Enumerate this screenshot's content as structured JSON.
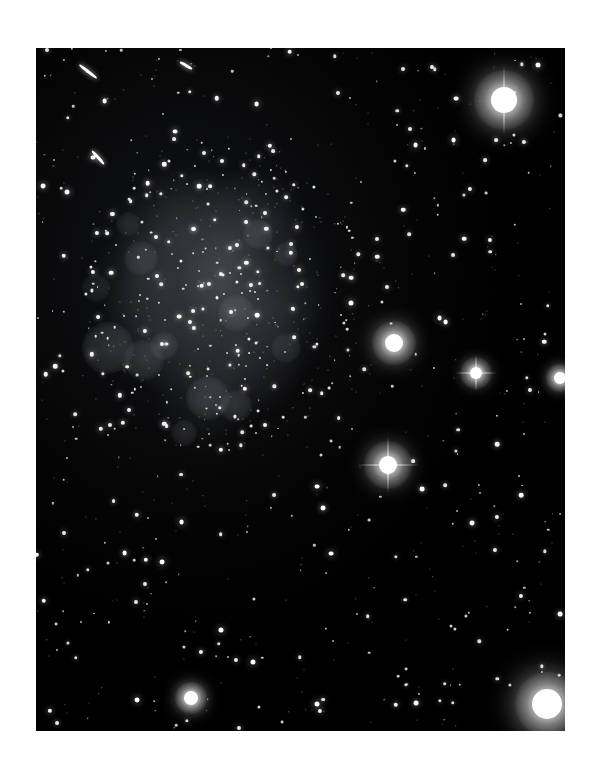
{
  "page": {
    "background_color": "#ffffff",
    "width": 594,
    "height": 779,
    "caption": ""
  },
  "plate": {
    "name": "astronomical-photographic-plate",
    "background_color": "#000000",
    "left": 36,
    "top": 48,
    "width": 529,
    "height": 683,
    "description": "Deep monochrome sky image of an irregular dwarf galaxy resolved into stars, surrounded by a dense foreground star field"
  },
  "chart_data": {
    "type": "scatter",
    "title": "",
    "subtitle": "",
    "xlabel": "",
    "ylabel": "",
    "xlim": [
      0,
      529
    ],
    "ylim": [
      0,
      683
    ],
    "grid": false,
    "legend": "none",
    "colormap": "grayscale",
    "background": "#000000",
    "note": "Pixel coordinates are relative to the plate frame (origin top-left of the black image area).",
    "galaxy": {
      "name": "irregular-dwarf-galaxy",
      "center_x": 185,
      "center_y": 245,
      "radius_x": 150,
      "radius_y": 165,
      "peak_brightness": 0.42,
      "morphology": "irregular / patchy, resolved into individual stars, sharp cutoff on east (right) side"
    },
    "hii_regions": [
      {
        "x": 72,
        "y": 300,
        "r": 26,
        "b": 0.17
      },
      {
        "x": 108,
        "y": 312,
        "r": 20,
        "b": 0.14
      },
      {
        "x": 128,
        "y": 298,
        "r": 14,
        "b": 0.12
      },
      {
        "x": 172,
        "y": 350,
        "r": 22,
        "b": 0.15
      },
      {
        "x": 200,
        "y": 358,
        "r": 16,
        "b": 0.13
      },
      {
        "x": 148,
        "y": 385,
        "r": 13,
        "b": 0.11
      },
      {
        "x": 222,
        "y": 186,
        "r": 15,
        "b": 0.12
      },
      {
        "x": 250,
        "y": 206,
        "r": 12,
        "b": 0.11
      },
      {
        "x": 105,
        "y": 210,
        "r": 17,
        "b": 0.12
      },
      {
        "x": 60,
        "y": 240,
        "r": 14,
        "b": 0.1
      },
      {
        "x": 200,
        "y": 265,
        "r": 18,
        "b": 0.13
      },
      {
        "x": 250,
        "y": 300,
        "r": 15,
        "b": 0.11
      },
      {
        "x": 92,
        "y": 176,
        "r": 12,
        "b": 0.1
      }
    ],
    "bright_stars": [
      {
        "x": 468,
        "y": 52,
        "r": 13,
        "mag": "saturated",
        "halo": 30,
        "spike": "vertical"
      },
      {
        "x": 511,
        "y": 656,
        "r": 15,
        "mag": "saturated",
        "halo": 32,
        "spike": "none"
      },
      {
        "x": 358,
        "y": 295,
        "r": 9,
        "mag": "bright",
        "halo": 22,
        "spike": "none"
      },
      {
        "x": 352,
        "y": 417,
        "r": 9,
        "mag": "bright",
        "halo": 24,
        "spike": "cross"
      },
      {
        "x": 440,
        "y": 325,
        "r": 6,
        "mag": "bright",
        "halo": 16,
        "spike": "cross"
      },
      {
        "x": 155,
        "y": 650,
        "r": 7,
        "mag": "bright",
        "halo": 16,
        "spike": "none"
      },
      {
        "x": 524,
        "y": 330,
        "r": 6,
        "mag": "bright",
        "halo": 14,
        "spike": "none"
      }
    ],
    "elongated_objects": [
      {
        "x": 52,
        "y": 22,
        "len": 22,
        "ang": 38
      },
      {
        "x": 62,
        "y": 108,
        "len": 18,
        "ang": 48
      },
      {
        "x": 150,
        "y": 16,
        "len": 14,
        "ang": 30
      }
    ],
    "field_star_count": 620,
    "star_size_range_px": [
      1,
      5
    ]
  },
  "labels": {
    "none_visible": ""
  }
}
